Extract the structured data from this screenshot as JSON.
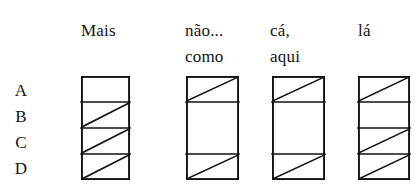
{
  "figure": {
    "ink_color": "#121212",
    "background_color": "#ffffff",
    "row_labels": [
      "A",
      "B",
      "C",
      "D"
    ],
    "columns": [
      {
        "id": "mais",
        "header_lines": [
          "",
          "Mais"
        ],
        "box": {
          "x": 81,
          "y": 76,
          "width": 49,
          "height": 104
        },
        "row_dividers": [
          "A",
          "B",
          "C"
        ],
        "cells": [
          {
            "row": "A",
            "filled": false
          },
          {
            "row": "B",
            "filled": true
          },
          {
            "row": "C",
            "filled": true
          },
          {
            "row": "D",
            "filled": true
          }
        ]
      },
      {
        "id": "nao-como",
        "header_lines": [
          "não...",
          "como"
        ],
        "box": {
          "x": 186,
          "y": 76,
          "width": 53,
          "height": 104
        },
        "row_dividers": [
          "A",
          "C"
        ],
        "cells": [
          {
            "row": "A",
            "filled": true
          },
          {
            "row": "B",
            "filled": false
          },
          {
            "row": "C",
            "filled": false
          },
          {
            "row": "D",
            "filled": true
          }
        ]
      },
      {
        "id": "ca-aqui",
        "header_lines": [
          "cá,",
          "aqui"
        ],
        "box": {
          "x": 272,
          "y": 76,
          "width": 53,
          "height": 104
        },
        "row_dividers": [
          "A",
          "C"
        ],
        "cells": [
          {
            "row": "A",
            "filled": true
          },
          {
            "row": "B",
            "filled": false
          },
          {
            "row": "C",
            "filled": false
          },
          {
            "row": "D",
            "filled": true
          }
        ]
      },
      {
        "id": "la",
        "header_lines": [
          "lá",
          ""
        ],
        "box": {
          "x": 358,
          "y": 76,
          "width": 52,
          "height": 104
        },
        "row_dividers": [
          "A",
          "B",
          "C"
        ],
        "cells": [
          {
            "row": "A",
            "filled": true
          },
          {
            "row": "B",
            "filled": false
          },
          {
            "row": "C",
            "filled": true
          },
          {
            "row": "D",
            "filled": true
          }
        ]
      }
    ],
    "header_positions": [
      {
        "id": "mais",
        "x": 81,
        "y": 18
      },
      {
        "id": "nao-como",
        "x": 185,
        "y": 18
      },
      {
        "id": "ca-aqui",
        "x": 270,
        "y": 18
      },
      {
        "id": "la",
        "x": 358,
        "y": 18
      }
    ],
    "row_label_positions": [
      {
        "label": "A",
        "y": 82
      },
      {
        "label": "B",
        "y": 108
      },
      {
        "label": "C",
        "y": 134
      },
      {
        "label": "D",
        "y": 160
      }
    ]
  }
}
